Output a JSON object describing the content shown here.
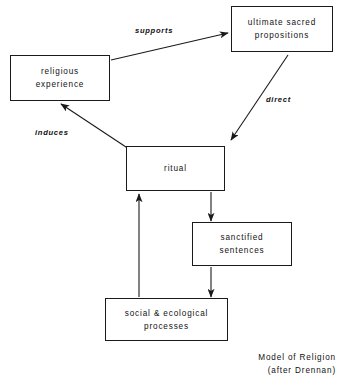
{
  "figure": {
    "caption_line1": "Model of Religion",
    "caption_line2": "(after Drennan)"
  },
  "nodes": [
    {
      "id": "ultimate-sacred-propositions",
      "label": "ultimate sacred\npropositions"
    },
    {
      "id": "religious-experience",
      "label": "religious\nexperience"
    },
    {
      "id": "ritual",
      "label": "ritual"
    },
    {
      "id": "sanctified-sentences",
      "label": "sanctified\nsentences"
    },
    {
      "id": "social-ecological-processes",
      "label": "social & ecological\nprocesses"
    }
  ],
  "edges": [
    {
      "id": "supports",
      "from": "religious-experience",
      "to": "ultimate-sacred-propositions",
      "label": "supports"
    },
    {
      "id": "direct",
      "from": "ultimate-sacred-propositions",
      "to": "ritual",
      "label": "direct"
    },
    {
      "id": "induces",
      "from": "ritual",
      "to": "religious-experience",
      "label": "induces"
    },
    {
      "id": "ritual-to-sanctified",
      "from": "ritual",
      "to": "sanctified-sentences",
      "label": ""
    },
    {
      "id": "sanctified-to-social",
      "from": "sanctified-sentences",
      "to": "social-ecological-processes",
      "label": ""
    },
    {
      "id": "social-to-ritual",
      "from": "social-ecological-processes",
      "to": "ritual",
      "label": ""
    }
  ],
  "colors": {
    "stroke": "#1a1a1a",
    "background": "#ffffff",
    "text": "#111111"
  }
}
